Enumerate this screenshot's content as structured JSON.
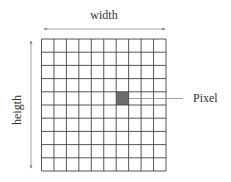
{
  "diagram": {
    "width_label": "width",
    "height_label": "heigth",
    "pixel_label": "Pixel",
    "grid": {
      "rows": 10,
      "cols": 10,
      "highlight_row": 4,
      "highlight_col": 6
    },
    "colors": {
      "grid_line": "#444444",
      "highlight": "#6e6e6e",
      "arrow": "#888888",
      "text": "#333333"
    }
  }
}
